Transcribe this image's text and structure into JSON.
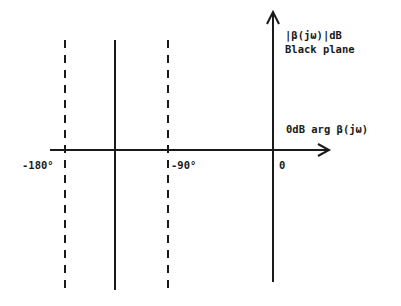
{
  "diagram": {
    "title": "Black plane",
    "y_axis": {
      "label_line1": "|β(jω)|dB",
      "label_line2": "Black plane"
    },
    "x_axis": {
      "label": "0dB arg β(jω)"
    },
    "ticks": [
      {
        "label": "-180°",
        "style": "dashed"
      },
      {
        "label": "-90°",
        "style": "dashed"
      },
      {
        "label": "0",
        "style": "axis"
      }
    ],
    "reference_line": {
      "style": "solid",
      "label": ""
    },
    "colors": {
      "ink": "#1a1a1a",
      "background": "#ffffff"
    }
  }
}
